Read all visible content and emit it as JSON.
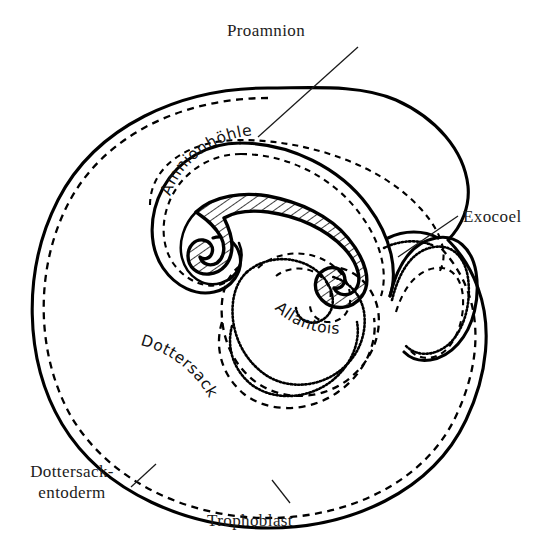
{
  "figure": {
    "title": "Proamnion",
    "kind": "embryological-schematic-diagram",
    "background_color": "#ffffff",
    "ink_color": "#000000"
  },
  "labels": {
    "proamnion": "Proamnion",
    "exocoel": "Exocoel",
    "amnionhoehle": "Amnionhöhle",
    "allantois": "Allantois",
    "dottersack": "Dottersack",
    "dottersack_entoderm_line1": "Dottersack-",
    "dottersack_entoderm_line2": "entoderm",
    "trophoblast": "Trophoblast"
  },
  "structures": [
    {
      "name": "trophoblast",
      "label": "Trophoblast",
      "line_style": "solid",
      "description": "outermost solid boundary of the conceptus"
    },
    {
      "name": "dottersack-entoderm",
      "label": "Dottersack-entoderm",
      "line_style": "dashed",
      "description": "dashed line lying just inside the trophoblast"
    },
    {
      "name": "dottersack",
      "label": "Dottersack",
      "line_style": "none",
      "description": "yolk sac cavity filling most of the vesicle"
    },
    {
      "name": "amnionhoehle",
      "label": "Amnionhöhle",
      "line_style": "solid-and-dashed",
      "description": "amniotic cavity enclosing the embryo"
    },
    {
      "name": "proamnion",
      "label": "Proamnion",
      "line_style": "solid",
      "description": "region where the amniotic fold meets the outer wall"
    },
    {
      "name": "allantois",
      "label": "Allantois",
      "line_style": "dotted-and-dashed",
      "description": "allantoic diverticulum below the embryo"
    },
    {
      "name": "exocoel",
      "label": "Exocoel",
      "line_style": "solid",
      "description": "extraembryonic coelom on the right flank"
    },
    {
      "name": "embryo",
      "label": "",
      "line_style": "hatched",
      "description": "hatched comma-shaped embryonic body"
    }
  ],
  "leader_lines": [
    {
      "name": "proamnion-leader",
      "from_label": "Proamnion",
      "points": "358,47 258,137"
    },
    {
      "name": "exocoel-leader",
      "from_label": "Exocoel",
      "points": "458,216 398,257"
    },
    {
      "name": "dottersack-entoderm-leader",
      "from_label": "Dottersack-entoderm",
      "points": "131,487 155,465"
    },
    {
      "name": "trophoblast-leader",
      "from_label": "Trophoblast",
      "points": "288,504 272,481"
    }
  ]
}
